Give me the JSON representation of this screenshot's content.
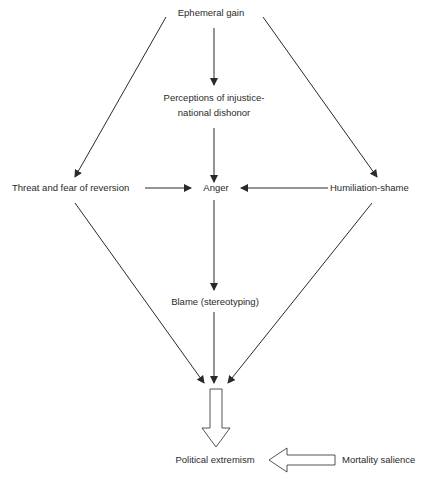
{
  "diagram": {
    "nodes": {
      "ephemeral_gain": "Ephemeral gain",
      "perceptions_line1": "Perceptions of injustice-",
      "perceptions_line2": "national dishonor",
      "threat": "Threat and fear of reversion",
      "anger": "Anger",
      "humiliation": "Humiliation-shame",
      "blame": "Blame (stereotyping)",
      "political_extremism": "Political extremism",
      "mortality_salience": "Mortality salience"
    },
    "edges": [
      {
        "from": "Ephemeral gain",
        "to": "Perceptions of injustice-national dishonor"
      },
      {
        "from": "Ephemeral gain",
        "to": "Threat and fear of reversion"
      },
      {
        "from": "Ephemeral gain",
        "to": "Humiliation-shame"
      },
      {
        "from": "Perceptions of injustice-national dishonor",
        "to": "Anger"
      },
      {
        "from": "Threat and fear of reversion",
        "to": "Anger"
      },
      {
        "from": "Humiliation-shame",
        "to": "Anger"
      },
      {
        "from": "Anger",
        "to": "Blame (stereotyping)"
      },
      {
        "from": "Threat and fear of reversion",
        "to": "Political extremism"
      },
      {
        "from": "Blame (stereotyping)",
        "to": "Political extremism"
      },
      {
        "from": "Humiliation-shame",
        "to": "Political extremism"
      },
      {
        "from": "Converging paths",
        "to": "Political extremism",
        "style": "hollow-arrow"
      },
      {
        "from": "Mortality salience",
        "to": "Political extremism",
        "style": "hollow-arrow"
      }
    ],
    "colors": {
      "line": "#2a2a2a",
      "text": "#2a2a2a",
      "background": "#ffffff"
    }
  }
}
